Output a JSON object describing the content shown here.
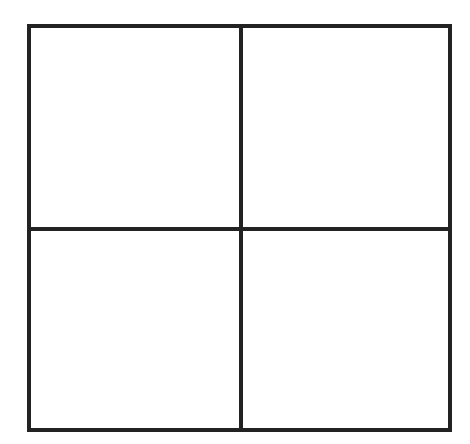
{
  "diagram": {
    "type": "grid",
    "rows": 2,
    "columns": 2,
    "line_color": "#222222",
    "background": "#ffffff",
    "cells": [
      {
        "row": 1,
        "col": 1,
        "label": ""
      },
      {
        "row": 1,
        "col": 2,
        "label": ""
      },
      {
        "row": 2,
        "col": 1,
        "label": ""
      },
      {
        "row": 2,
        "col": 2,
        "label": ""
      }
    ]
  }
}
